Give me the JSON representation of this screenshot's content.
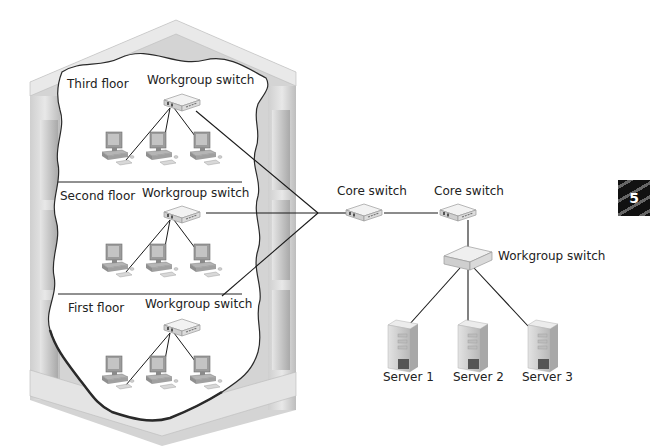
{
  "figure": {
    "chapter_badge": "5",
    "building": {
      "floors": [
        {
          "name": "Third floor",
          "switch_label": "Workgroup switch",
          "computers": 3
        },
        {
          "name": "Second floor",
          "switch_label": "Workgroup switch",
          "computers": 3
        },
        {
          "name": "First floor",
          "switch_label": "Workgroup switch",
          "computers": 3
        }
      ]
    },
    "core": {
      "switches": [
        {
          "label": "Core switch"
        },
        {
          "label": "Core switch"
        }
      ]
    },
    "server_room": {
      "switch_label": "Workgroup switch",
      "servers": [
        {
          "label": "Server 1"
        },
        {
          "label": "Server 2"
        },
        {
          "label": "Server 3"
        }
      ]
    }
  }
}
